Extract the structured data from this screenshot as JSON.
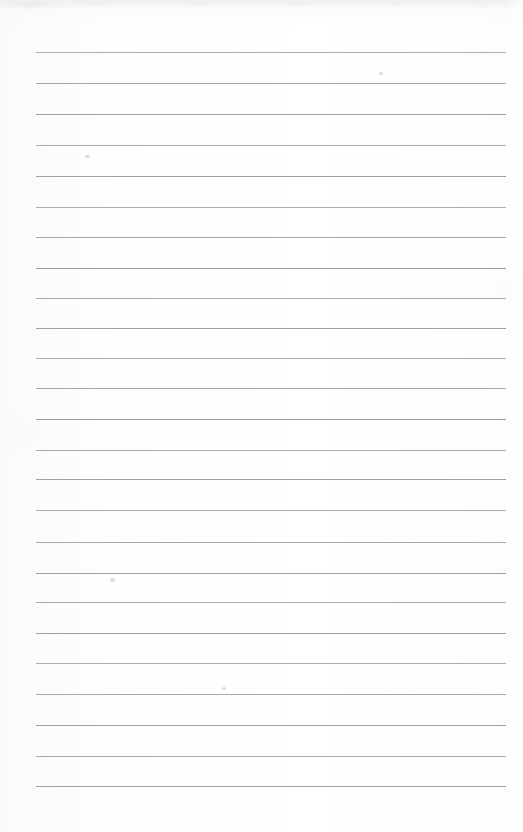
{
  "document": {
    "type": "scanned-lined-notebook-page",
    "title": "Blank ruled notebook page",
    "visible_text": "",
    "page_width": 523,
    "page_height": 832,
    "background_color": "#fdfdfd",
    "rule_color": "#9a9a9e"
  },
  "ruling": {
    "line_count": 25,
    "line_thickness": 1,
    "first_line_y": 52,
    "line_spacing": 30.55,
    "left_margin_x": 36,
    "right_edge_x": 506,
    "line_length": 470,
    "lines_y": [
      52,
      83,
      114,
      145,
      176,
      207,
      237,
      268,
      298,
      328,
      358,
      388,
      419,
      450,
      479,
      510,
      542,
      573,
      602,
      633,
      663,
      694,
      725,
      756,
      786
    ]
  },
  "artifacts": {
    "smudges": [
      {
        "x": 85,
        "y": 155,
        "w": 5,
        "h": 3
      },
      {
        "x": 110,
        "y": 578,
        "w": 5,
        "h": 4
      },
      {
        "x": 222,
        "y": 687,
        "w": 4,
        "h": 3
      },
      {
        "x": 379,
        "y": 72,
        "w": 4,
        "h": 3
      }
    ],
    "top_edge_shading": true
  }
}
